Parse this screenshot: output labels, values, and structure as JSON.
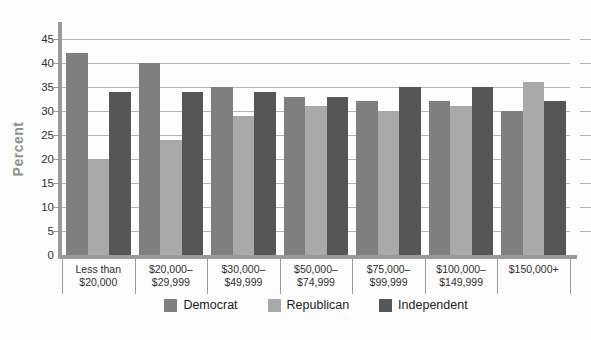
{
  "chart_data": {
    "type": "bar",
    "grouped": true,
    "title": "",
    "xlabel": "",
    "ylabel": "Percent",
    "ylim": [
      0,
      48
    ],
    "yticks": [
      0,
      5,
      10,
      15,
      20,
      25,
      30,
      35,
      40,
      45
    ],
    "grid": "horizontal",
    "legend_position": "bottom-center",
    "categories": [
      "Less than $20,000",
      "$20,000–$29,999",
      "$30,000–$49,999",
      "$50,000–$74,999",
      "$75,000–$99,999",
      "$100,000–$149,999",
      "$150,000+"
    ],
    "category_label_lines": [
      [
        "Less than",
        "$20,000"
      ],
      [
        "$20,000–",
        "$29,999"
      ],
      [
        "$30,000–",
        "$49,999"
      ],
      [
        "$50,000–",
        "$74,999"
      ],
      [
        "$75,000–",
        "$99,999"
      ],
      [
        "$100,000–",
        "$149,999"
      ],
      [
        "$150,000+"
      ]
    ],
    "series": [
      {
        "name": "Democrat",
        "color": "#7f7f7f",
        "values": [
          42,
          40,
          35,
          33,
          32,
          32,
          30
        ]
      },
      {
        "name": "Republican",
        "color": "#a9a9a9",
        "values": [
          20,
          24,
          29,
          31,
          30,
          31,
          36
        ]
      },
      {
        "name": "Independent",
        "color": "#565656",
        "values": [
          34,
          34,
          34,
          33,
          35,
          35,
          32
        ]
      }
    ],
    "colors": {
      "axis": "#9a9a9a",
      "gridline": "#b5b5b5",
      "tick_text": "#2f2f2f",
      "ylabel_text": "#909090",
      "legend_text": "#1c1c1c",
      "background": "#fdfdfd"
    }
  }
}
